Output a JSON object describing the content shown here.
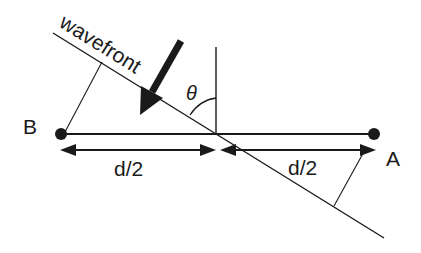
{
  "diagram": {
    "labels": {
      "wavefront": "wavefront",
      "theta": "θ",
      "point_b": "B",
      "point_a": "A",
      "half_baseline_left": "d/2",
      "half_baseline_right": "d/2"
    },
    "colors": {
      "ink": "#1a1a1a",
      "background": "#ffffff"
    },
    "elements": [
      {
        "type": "line",
        "name": "wavefront-line"
      },
      {
        "type": "arrow",
        "name": "propagation-arrow",
        "direction": "down-left"
      },
      {
        "type": "line",
        "name": "vertical-reference"
      },
      {
        "type": "arc",
        "name": "theta-arc"
      },
      {
        "type": "line",
        "name": "baseline"
      },
      {
        "type": "dot",
        "name": "antenna-b"
      },
      {
        "type": "dot",
        "name": "antenna-a"
      },
      {
        "type": "double-arrow",
        "name": "dimension-left"
      },
      {
        "type": "double-arrow",
        "name": "dimension-right"
      },
      {
        "type": "line",
        "name": "perpendicular-b"
      },
      {
        "type": "line",
        "name": "perpendicular-a"
      }
    ]
  }
}
